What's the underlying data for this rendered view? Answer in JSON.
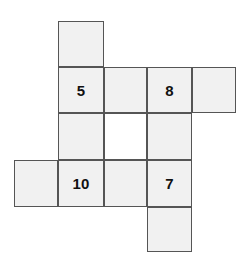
{
  "figure": {
    "kind": "number-grid-puzzle",
    "background_color": "#ffffff",
    "cell_fill_color": "#f1f1f1",
    "cell_blank_color": "#ffffff",
    "cell_border_color": "#555555",
    "text_color": "#111111",
    "cell_size": 45,
    "columns_x": [
      14,
      58,
      104,
      147,
      192
    ],
    "rows_y": [
      21,
      67,
      113,
      160,
      207
    ]
  },
  "cells": [
    {
      "id": "r1c1",
      "row": 1,
      "col": 1,
      "x": 58,
      "y": 21,
      "w": 46,
      "h": 46,
      "label": "",
      "filled": true
    },
    {
      "id": "r2c1",
      "row": 2,
      "col": 1,
      "x": 58,
      "y": 67,
      "w": 46,
      "h": 46,
      "label": "5",
      "filled": true
    },
    {
      "id": "r2c2",
      "row": 2,
      "col": 2,
      "x": 104,
      "y": 67,
      "w": 43,
      "h": 46,
      "label": "",
      "filled": true
    },
    {
      "id": "r2c3",
      "row": 2,
      "col": 3,
      "x": 147,
      "y": 67,
      "w": 45,
      "h": 46,
      "label": "8",
      "filled": true
    },
    {
      "id": "r2c4",
      "row": 2,
      "col": 4,
      "x": 192,
      "y": 67,
      "w": 44,
      "h": 46,
      "label": "",
      "filled": true
    },
    {
      "id": "r3c1",
      "row": 3,
      "col": 1,
      "x": 58,
      "y": 113,
      "w": 46,
      "h": 47,
      "label": "",
      "filled": true
    },
    {
      "id": "r3c2",
      "row": 3,
      "col": 2,
      "x": 104,
      "y": 113,
      "w": 43,
      "h": 47,
      "label": "",
      "filled": false
    },
    {
      "id": "r3c3",
      "row": 3,
      "col": 3,
      "x": 147,
      "y": 113,
      "w": 45,
      "h": 47,
      "label": "",
      "filled": true
    },
    {
      "id": "r4c0",
      "row": 4,
      "col": 0,
      "x": 14,
      "y": 160,
      "w": 44,
      "h": 47,
      "label": "",
      "filled": true
    },
    {
      "id": "r4c1",
      "row": 4,
      "col": 1,
      "x": 58,
      "y": 160,
      "w": 46,
      "h": 47,
      "label": "10",
      "filled": true
    },
    {
      "id": "r4c2",
      "row": 4,
      "col": 2,
      "x": 104,
      "y": 160,
      "w": 43,
      "h": 47,
      "label": "",
      "filled": true
    },
    {
      "id": "r4c3",
      "row": 4,
      "col": 3,
      "x": 147,
      "y": 160,
      "w": 45,
      "h": 47,
      "label": "7",
      "filled": true
    },
    {
      "id": "r5c3",
      "row": 5,
      "col": 3,
      "x": 147,
      "y": 207,
      "w": 45,
      "h": 45,
      "label": "",
      "filled": true
    }
  ]
}
